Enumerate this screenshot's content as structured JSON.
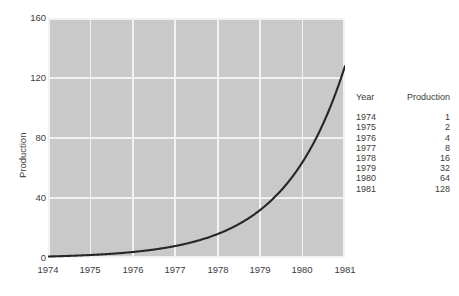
{
  "chart_data": {
    "type": "line",
    "title": "",
    "xlabel": "",
    "ylabel": "Production",
    "x": [
      1974,
      1975,
      1976,
      1977,
      1978,
      1979,
      1980,
      1981
    ],
    "values": [
      1,
      2,
      4,
      8,
      16,
      32,
      64,
      128
    ],
    "series": [
      {
        "name": "Production",
        "values": [
          1,
          2,
          4,
          8,
          16,
          32,
          64,
          128
        ]
      }
    ],
    "xlim": [
      1974,
      1981
    ],
    "ylim": [
      0,
      160
    ],
    "xticks": [
      "1974",
      "1975",
      "1976",
      "1977",
      "1978",
      "1979",
      "1980",
      "1981"
    ],
    "yticks": [
      "0",
      "40",
      "80",
      "120",
      "160"
    ],
    "grid": true,
    "legend": "none",
    "plot_background": "#c9c9c9",
    "gridline_color": "#f2f2f2",
    "line_color": "#262626",
    "figure_background": "#ffffff"
  },
  "axes": {
    "y_title": "Production",
    "y_ticks": [
      {
        "label": "160",
        "value": 160
      },
      {
        "label": "120",
        "value": 120
      },
      {
        "label": "80",
        "value": 80
      },
      {
        "label": "40",
        "value": 40
      },
      {
        "label": "0",
        "value": 0
      }
    ],
    "x_ticks": [
      {
        "label": "1974"
      },
      {
        "label": "1975"
      },
      {
        "label": "1976"
      },
      {
        "label": "1977"
      },
      {
        "label": "1978"
      },
      {
        "label": "1979"
      },
      {
        "label": "1980"
      },
      {
        "label": "1981"
      }
    ]
  },
  "table": {
    "headers": {
      "year": "Year",
      "production": "Production"
    },
    "rows": [
      {
        "year": "1974",
        "production": "1"
      },
      {
        "year": "1975",
        "production": "2"
      },
      {
        "year": "1976",
        "production": "4"
      },
      {
        "year": "1977",
        "production": "8"
      },
      {
        "year": "1978",
        "production": "16"
      },
      {
        "year": "1979",
        "production": "32"
      },
      {
        "year": "1980",
        "production": "64"
      },
      {
        "year": "1981",
        "production": "128"
      }
    ]
  }
}
